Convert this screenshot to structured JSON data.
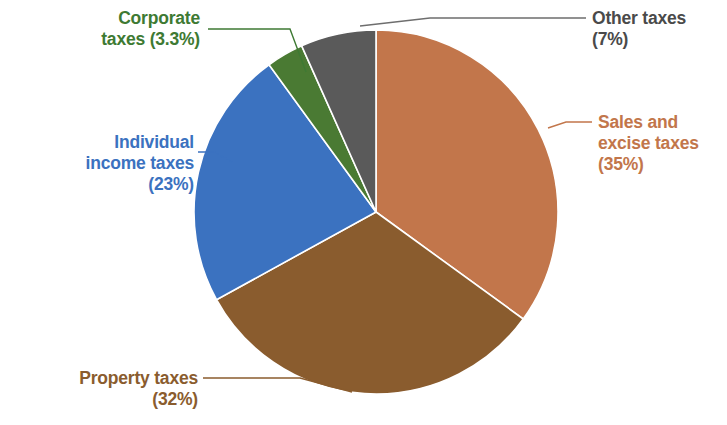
{
  "chart_data": {
    "type": "pie",
    "title": "",
    "subtitle": "",
    "xlabel": "",
    "ylabel": "",
    "legend_position": "callout-labels",
    "grid": false,
    "total_percent": 100.3,
    "start_angle_deg": 0,
    "direction": "clockwise",
    "center": {
      "cx": 376,
      "cy": 212,
      "r": 182
    },
    "categories": [
      "Sales and excise taxes",
      "Property taxes",
      "Individual income taxes",
      "Corporate taxes",
      "Other taxes"
    ],
    "values": [
      35,
      32,
      23,
      3.3,
      7
    ],
    "value_labels": [
      "(35%)",
      "(32%)",
      "(23%)",
      "(3.3%)",
      "(7%)"
    ],
    "colors": [
      "#C2764B",
      "#8A5C2E",
      "#3B72C0",
      "#4A7A33",
      "#5A5A5A"
    ],
    "slices": [
      {
        "name": "Sales and excise taxes",
        "label_line1": "Sales and",
        "label_line2": "excise taxes",
        "value": 35,
        "value_label": "(35%)",
        "color": "#C2764B",
        "start_deg": 0,
        "end_deg": 126
      },
      {
        "name": "Property taxes",
        "label_line1": "Property taxes",
        "label_line2": "",
        "value": 32,
        "value_label": "(32%)",
        "color": "#8A5C2E",
        "start_deg": 126,
        "end_deg": 241.2
      },
      {
        "name": "Individual income taxes",
        "label_line1": "Individual",
        "label_line2": "income taxes",
        "value": 23,
        "value_label": "(23%)",
        "color": "#3B72C0",
        "start_deg": 241.2,
        "end_deg": 324
      },
      {
        "name": "Corporate taxes",
        "label_line1": "Corporate",
        "label_line2": "taxes",
        "value": 3.3,
        "value_label": "(3.3%)",
        "color": "#4A7A33",
        "start_deg": 324,
        "end_deg": 335.9
      },
      {
        "name": "Other taxes",
        "label_line1": "Other taxes",
        "label_line2": "",
        "value": 7,
        "value_label": "(7%)",
        "color": "#5A5A5A",
        "start_deg": 335.9,
        "end_deg": 360
      }
    ]
  },
  "labels": {
    "corporate": {
      "line1": "Corporate",
      "line2": "taxes",
      "pct": "(3.3%)",
      "color": "#3E7A33"
    },
    "other": {
      "line1": "Other taxes",
      "pct": "(7%)",
      "color": "#4A4A4A"
    },
    "sales": {
      "line1": "Sales and",
      "line2": "excise taxes",
      "pct": "(35%)",
      "color": "#C2764B"
    },
    "individual": {
      "line1": "Individual",
      "line2": "income taxes",
      "pct": "(23%)",
      "color": "#3B72C0"
    },
    "property": {
      "line1": "Property taxes",
      "pct": "(32%)",
      "color": "#8A5C2E"
    }
  }
}
